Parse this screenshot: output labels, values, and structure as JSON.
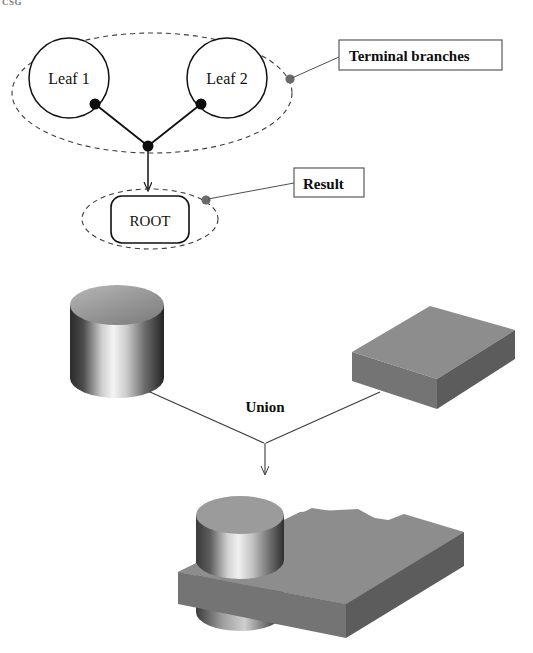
{
  "figure": {
    "top_fragment": "CSG",
    "tree": {
      "leaf1_label": "Leaf 1",
      "leaf2_label": "Leaf 2",
      "root_label": "ROOT",
      "terminal_callout": "Terminal branches",
      "result_callout": "Result"
    },
    "operation": {
      "label": "Union",
      "operand_left": "cylinder",
      "operand_right": "rectangular-block",
      "result": "cylinder-union-block"
    },
    "colors": {
      "stroke": "#1a1a1a",
      "dashed_stroke": "#3c3c3c",
      "callout_dot": "#6b6b6b",
      "leader_line": "#4f4f4f",
      "solid_top": "#8d8d8d",
      "solid_front": "#7b7b7b",
      "solid_side": "#5d5d5d",
      "cylinder_dark": "#2e2e2e",
      "cylinder_light": "#f2f2f2",
      "background": "#ffffff"
    }
  }
}
